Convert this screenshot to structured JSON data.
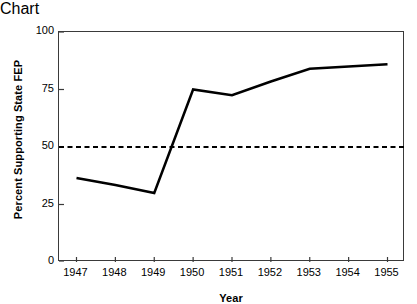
{
  "chart_data": {
    "type": "line",
    "title": "",
    "subtitle": "",
    "xlabel": "Year",
    "ylabel": "Percent Supporting State FEP",
    "categories": [
      "1947",
      "1948",
      "1949",
      "1950",
      "1951",
      "1952",
      "1953",
      "1954",
      "1955"
    ],
    "x": [
      1947,
      1948,
      1949,
      1950,
      1951,
      1952,
      1953,
      1954,
      1955
    ],
    "series": [
      {
        "name": "Percent Supporting State FEP",
        "values": [
          36.5,
          33.5,
          30,
          75,
          72.5,
          78.5,
          84,
          85,
          86
        ],
        "style": "solid",
        "color": "#000000",
        "width": 2.5
      }
    ],
    "reference_lines": [
      {
        "name": "majority-threshold",
        "orientation": "horizontal",
        "value": 50,
        "style": "dashed",
        "color": "#000000"
      }
    ],
    "xlim": [
      1946.55,
      1955.45
    ],
    "ylim": [
      0,
      100
    ],
    "yticks": [
      0,
      25,
      50,
      75,
      100
    ],
    "ytick_labels": [
      "0",
      "25",
      "50",
      "75",
      "100"
    ],
    "xticks": [
      1947,
      1948,
      1949,
      1950,
      1951,
      1952,
      1953,
      1954,
      1955
    ],
    "xtick_labels": [
      "1947",
      "1948",
      "1949",
      "1950",
      "1951",
      "1952",
      "1953",
      "1954",
      "1955"
    ],
    "grid": false,
    "legend": null,
    "legend_position": "none",
    "annotations": [],
    "axis_color": "#3a3a3a",
    "background_color": "#ffffff"
  }
}
